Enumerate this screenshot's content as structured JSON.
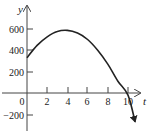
{
  "chart_data": {
    "type": "line",
    "title": "",
    "xlabel": "t",
    "ylabel": "y",
    "x_ticks": [
      0,
      2,
      4,
      6,
      8,
      10
    ],
    "y_ticks": [
      -200,
      200,
      400,
      600
    ],
    "xlim": [
      0,
      11
    ],
    "ylim": [
      -300,
      700
    ],
    "grid": false,
    "legend": null,
    "series": [
      {
        "name": "y(t)",
        "x": [
          0,
          1,
          2,
          3,
          4,
          5,
          6,
          7,
          8,
          9,
          10,
          10.7
        ],
        "values": [
          330,
          445,
          525,
          575,
          585,
          560,
          500,
          400,
          270,
          110,
          -20,
          -270
        ]
      }
    ]
  },
  "labels": {
    "x_axis": "t",
    "y_axis": "y",
    "origin": "0",
    "x_tick_2": "2",
    "x_tick_4": "4",
    "x_tick_6": "6",
    "x_tick_8": "8",
    "x_tick_10": "10",
    "y_tick_600": "600",
    "y_tick_400": "400",
    "y_tick_200": "200",
    "y_tick_neg200": "−200"
  }
}
